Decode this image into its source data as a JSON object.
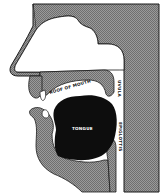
{
  "diagram": {
    "type": "anatomical cross-section of head (mouth and throat)",
    "labels": {
      "roof_of_mouth": "ROOF OF MOUTH",
      "uvula": "UVULA",
      "tongue": "TONGUE",
      "epiglottis": "EPIGLOTTIS"
    },
    "colors": {
      "tissue": "#8a8a8a",
      "outline": "#1a1a1a",
      "tongue": "#0d0d0d",
      "cavity": "#ffffff",
      "teeth": "#ffffff"
    }
  }
}
